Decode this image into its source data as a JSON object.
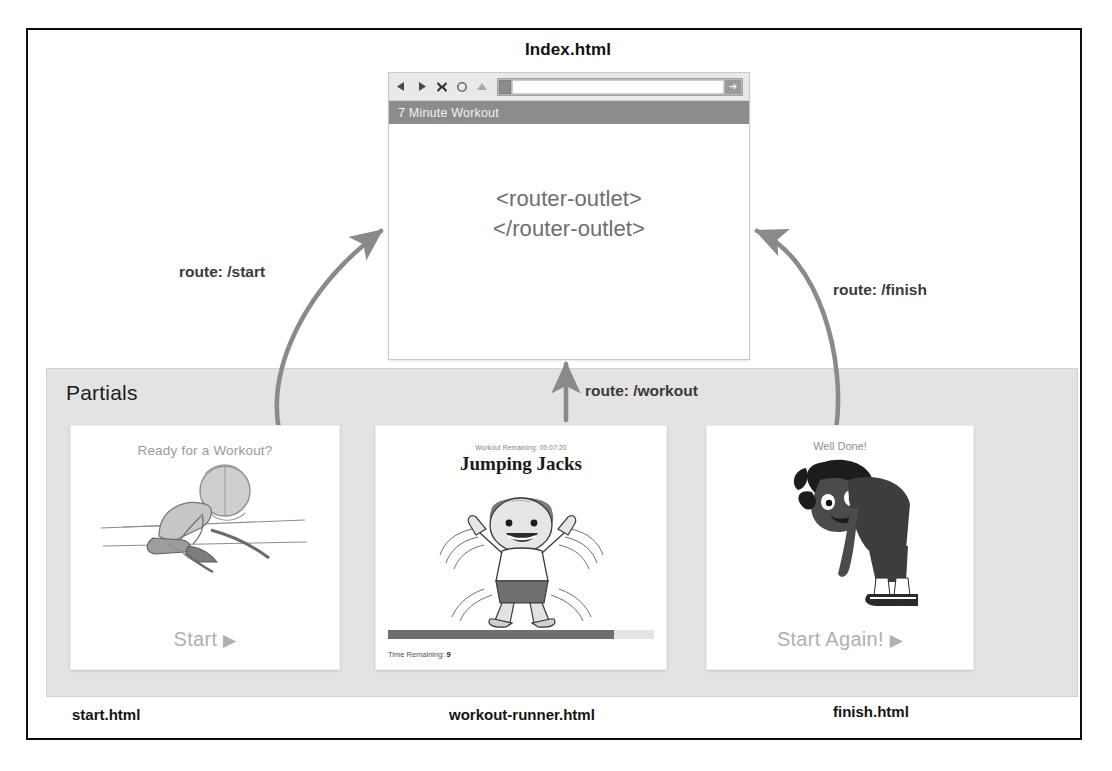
{
  "diagram": {
    "title_node": "Index.html",
    "partials_region_label": "Partials",
    "routes": {
      "start": "route: /start",
      "workout": "route: /workout",
      "finish": "route: /finish"
    },
    "file_labels": {
      "start": "start.html",
      "workout": "workout-runner.html",
      "finish": "finish.html"
    }
  },
  "browser": {
    "toolbar": {
      "back_icon": "back-arrow-icon",
      "forward_icon": "forward-arrow-icon",
      "stop_icon": "stop-x-icon",
      "reload_icon": "reload-circle-icon",
      "home_icon": "home-icon",
      "favicon": "favicon-icon",
      "address_value": "",
      "address_placeholder": "",
      "go_label": "➜"
    },
    "app_title": "7 Minute Workout",
    "content": {
      "line1": "<router-outlet>",
      "line2": "</router-outlet>"
    }
  },
  "cards": {
    "start": {
      "heading": "Ready for a Workout?",
      "cta": "Start",
      "cta_icon": "play-triangle-icon",
      "illustration": "person-tying-shoelaces-sketch"
    },
    "workout": {
      "remaining_label": "Workout Remaining:",
      "remaining_value": "00:07:20",
      "exercise_title": "Jumping Jacks",
      "illustration": "jumping-jacks-kid",
      "progress_percent": 85,
      "time_remaining_label": "Time Remaining:",
      "time_remaining_value": "9"
    },
    "finish": {
      "heading": "Well Done!",
      "cta": "Start Again!",
      "cta_icon": "play-triangle-icon",
      "illustration": "person-bending-over"
    }
  },
  "colors": {
    "frame": "#0e0e0e",
    "partials_bg": "#e3e3e3",
    "appbar": "#8c8c8c",
    "arrow": "#8a8a8a",
    "progress_fill": "#6f6f6f",
    "muted_text": "#9a9a9a"
  }
}
